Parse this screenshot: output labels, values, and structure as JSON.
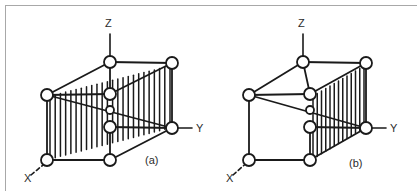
{
  "figure": {
    "background_color": "#ffffff",
    "line_color": "#1a1a1a",
    "frame_color": "#a8a8a8",
    "node_fill": "#ffffff"
  },
  "panels": [
    {
      "id": "a",
      "caption": "(a)",
      "caption_pos": {
        "x": 145,
        "y": 164
      },
      "axes": [
        {
          "name": "Z",
          "label": "Z",
          "label_pos": {
            "x": 105,
            "y": 27
          },
          "line": {
            "x1": 110,
            "y1": 34,
            "x2": 110,
            "y2": 56
          },
          "style": "solid"
        },
        {
          "name": "Y",
          "label": "Y",
          "label_pos": {
            "x": 196,
            "y": 132
          },
          "line": {
            "x1": 178,
            "y1": 128,
            "x2": 192,
            "y2": 128
          },
          "style": "solid"
        },
        {
          "name": "X",
          "label": "X",
          "label_pos": {
            "x": 24,
            "y": 182
          },
          "line": {
            "x1": 31,
            "y1": 175,
            "x2": 49,
            "y2": 160
          },
          "style": "dashed"
        }
      ],
      "nodes": [
        {
          "name": "top-front",
          "x": 110,
          "y": 62,
          "r": 6
        },
        {
          "name": "top-back",
          "x": 172,
          "y": 63,
          "r": 6
        },
        {
          "name": "mid-left",
          "x": 47,
          "y": 95,
          "r": 6
        },
        {
          "name": "mid-center",
          "x": 110,
          "y": 94,
          "r": 6
        },
        {
          "name": "mid-small",
          "x": 110,
          "y": 110,
          "r": 4
        },
        {
          "name": "mid-lower",
          "x": 110,
          "y": 127,
          "r": 6
        },
        {
          "name": "mid-right",
          "x": 172,
          "y": 128,
          "r": 6
        },
        {
          "name": "bot-left",
          "x": 47,
          "y": 160,
          "r": 6
        },
        {
          "name": "bot-center",
          "x": 110,
          "y": 160,
          "r": 6
        }
      ],
      "hatch": {
        "count": 23,
        "x_start": 50,
        "x_end": 170,
        "top_left_y": 96,
        "top_right_y": 66,
        "bot_left_y": 159,
        "bot_right_y": 128
      }
    },
    {
      "id": "b",
      "caption": "(b)",
      "caption_pos": {
        "x": 349,
        "y": 167
      },
      "axes": [
        {
          "name": "Z",
          "label": "Z",
          "label_pos": {
            "x": 298,
            "y": 27
          },
          "line": {
            "x1": 303,
            "y1": 34,
            "x2": 303,
            "y2": 56
          },
          "style": "solid"
        },
        {
          "name": "Y",
          "label": "Y",
          "label_pos": {
            "x": 390,
            "y": 132
          },
          "line": {
            "x1": 372,
            "y1": 128,
            "x2": 386,
            "y2": 128
          },
          "style": "solid"
        },
        {
          "name": "X",
          "label": "X",
          "label_pos": {
            "x": 226,
            "y": 182
          },
          "line": {
            "x1": 233,
            "y1": 175,
            "x2": 250,
            "y2": 160
          },
          "style": "dashed"
        }
      ],
      "nodes": [
        {
          "name": "top-front",
          "x": 303,
          "y": 62,
          "r": 6
        },
        {
          "name": "top-back",
          "x": 366,
          "y": 63,
          "r": 6
        },
        {
          "name": "mid-left",
          "x": 249,
          "y": 95,
          "r": 6
        },
        {
          "name": "mid-center",
          "x": 310,
          "y": 94,
          "r": 6
        },
        {
          "name": "mid-small",
          "x": 310,
          "y": 110,
          "r": 4
        },
        {
          "name": "mid-lower",
          "x": 310,
          "y": 127,
          "r": 6
        },
        {
          "name": "mid-right",
          "x": 366,
          "y": 128,
          "r": 6
        },
        {
          "name": "bot-left",
          "x": 249,
          "y": 160,
          "r": 6
        },
        {
          "name": "bot-center",
          "x": 310,
          "y": 160,
          "r": 6
        }
      ],
      "hatch": {
        "count": 12,
        "x_start": 313,
        "x_end": 364,
        "top_left_y": 96,
        "top_right_y": 66,
        "bot_left_y": 159,
        "bot_right_y": 128
      }
    }
  ]
}
